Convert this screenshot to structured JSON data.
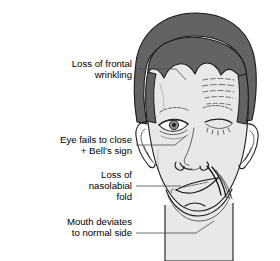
{
  "figure": {
    "background_color": "#ffffff",
    "colors": {
      "hair": "#636363",
      "skin": "#e8e8e8",
      "outline": "#1a1a1a",
      "leader_line": "#4d4d4d",
      "text": "#000000",
      "iris": "#8a8a8a",
      "pupil": "#1a1a1a"
    }
  },
  "annotations": [
    {
      "id": "frontal-wrinkling",
      "lines": [
        "Loss of frontal",
        "wrinkling"
      ],
      "text_anchor_x": 132,
      "text_y_first": 64,
      "line_height": 11,
      "leader": "M136,69 L176,69 L186,80"
    },
    {
      "id": "eye-closure",
      "lines": [
        "Eye fails to close",
        "+ Bell's sign"
      ],
      "text_anchor_x": 132,
      "text_y_first": 140,
      "line_height": 11,
      "leader": "M136,145 L175,145 L186,136"
    },
    {
      "id": "nasolabial-fold",
      "lines": [
        "Loss of",
        "nasolabial",
        "fold"
      ],
      "text_anchor_x": 132,
      "text_y_first": 175,
      "line_height": 11,
      "leader": "M136,186 L181,186"
    },
    {
      "id": "mouth-deviation",
      "lines": [
        "Mouth deviates",
        "to normal side"
      ],
      "text_anchor_x": 132,
      "text_y_first": 222,
      "line_height": 11,
      "leader": "M136,233 L196,233 L214,221"
    }
  ],
  "features": {
    "hair": "dark gray swept hair with widow's peak and sideburns",
    "forehead_wrinkles_side": "viewer right (normal side) only",
    "left_eye_state": "wide open, iris and pupil visible — fails to close",
    "right_eye_state": "closed with lashes",
    "nasolabial_fold_side": "deep on viewer right, absent on viewer left",
    "mouth": "deviated upward toward viewer right (normal side)",
    "ears": "both ears visible",
    "neck": "visible below jaw, extends to bottom edge"
  }
}
